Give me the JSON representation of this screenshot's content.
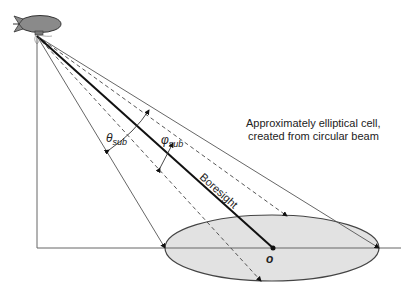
{
  "diagram": {
    "annotation_line1": "Approximately elliptical cell,",
    "annotation_line2": "created from circular beam",
    "boresight_label": "Boresight",
    "theta_label": {
      "symbol": "θ",
      "sub": "sub"
    },
    "phi_label": {
      "symbol": "φ",
      "sub": "sub"
    },
    "origin_label": "o",
    "icons": [
      "airship-icon"
    ],
    "colors": {
      "line": "#333333",
      "ellipse_fill": "#e2e2e2",
      "airship_fill": "#8a8a8a"
    }
  }
}
